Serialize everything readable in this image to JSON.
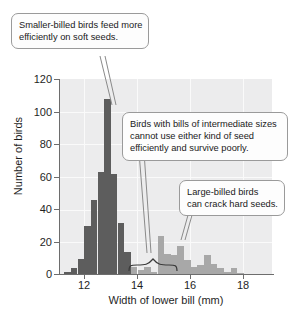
{
  "chart_data": {
    "type": "bar",
    "title": "",
    "subtitle": "",
    "xlabel": "Width of lower bill (mm)",
    "ylabel": "Number of birds",
    "xlim": [
      11.3,
      19.3
    ],
    "ylim": [
      0,
      120
    ],
    "xticks": [
      12,
      14,
      16,
      18
    ],
    "yticks": [
      0,
      20,
      40,
      60,
      80,
      100,
      120
    ],
    "grid": true,
    "legend": "none",
    "bin_width": 0.25,
    "bar_color_small_billed": "#5d5d5d",
    "bar_color_large_billed": "#a8a8a8",
    "plot_background": "#ececed",
    "categories": [
      11.5,
      11.75,
      12.0,
      12.25,
      12.5,
      12.75,
      13.0,
      13.25,
      13.5,
      13.75,
      14.0,
      14.25,
      14.5,
      14.75,
      15.0,
      15.25,
      15.5,
      15.75,
      16.0,
      16.25,
      16.5,
      16.75,
      17.0,
      17.25,
      17.5,
      17.75,
      18.0,
      18.25
    ],
    "values": [
      2,
      4,
      10,
      30,
      46,
      63,
      108,
      62,
      32,
      14,
      5,
      3,
      5,
      2,
      24,
      13,
      12,
      18,
      9,
      5,
      6,
      12,
      7,
      4,
      2,
      4,
      1,
      0
    ],
    "series": [
      {
        "name": "Smaller-billed birds",
        "color": "#5d5d5d",
        "x": [
          11.5,
          11.75,
          12.0,
          12.25,
          12.5,
          12.75,
          13.0,
          13.25,
          13.5,
          13.75
        ],
        "values": [
          2,
          4,
          10,
          30,
          46,
          63,
          108,
          62,
          32,
          14
        ]
      },
      {
        "name": "Large-billed birds",
        "color": "#a8a8a8",
        "x": [
          14.0,
          14.25,
          14.5,
          14.75,
          15.0,
          15.25,
          15.5,
          15.75,
          16.0,
          16.25,
          16.5,
          16.75,
          17.0,
          17.25,
          17.5,
          17.75,
          18.0
        ],
        "values": [
          5,
          3,
          5,
          2,
          24,
          13,
          12,
          18,
          9,
          5,
          6,
          12,
          7,
          4,
          2,
          4,
          1
        ]
      }
    ],
    "annotations": [
      {
        "id": "smaller-billed",
        "lines": [
          "Smaller-billed birds feed more",
          "efficiently on soft seeds."
        ],
        "points_to_x": 12.9
      },
      {
        "id": "intermediate",
        "lines": [
          "Birds with bills of intermediate sizes",
          "cannot use either kind of seed",
          "efficiently and survive poorly."
        ],
        "points_to_x": 14.2
      },
      {
        "id": "large-billed",
        "lines": [
          "Large-billed birds",
          "can crack hard seeds."
        ],
        "points_to_x": 15.8
      }
    ]
  },
  "axes": {
    "ylabel": "Number of birds",
    "xlabel": "Width of lower bill (mm)",
    "ytick_labels": [
      "0",
      "20",
      "40",
      "60",
      "80",
      "100",
      "120"
    ],
    "xtick_labels": [
      "12",
      "14",
      "16",
      "18"
    ]
  },
  "callouts": {
    "smaller": {
      "line1": "Smaller-billed birds feed more",
      "line2": "efficiently on soft seeds."
    },
    "intermediate": {
      "line1": "Birds with bills of intermediate sizes",
      "line2": "cannot use either kind of seed",
      "line3": "efficiently and survive poorly."
    },
    "large": {
      "line1": "Large-billed birds",
      "line2": "can crack hard seeds."
    }
  }
}
